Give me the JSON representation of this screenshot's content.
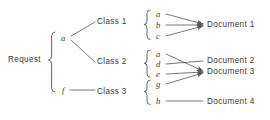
{
  "diagram": {
    "ink_color": "#3a3a3a",
    "line_color": "#555555",
    "background": "#ffffff",
    "root": {
      "label": "Request"
    },
    "level1_nodes": [
      {
        "id": "a",
        "label": "a"
      },
      {
        "id": "f",
        "label": "f"
      }
    ],
    "classes": [
      {
        "id": "class1",
        "label": "Class 1"
      },
      {
        "id": "class2",
        "label": "Class 2"
      },
      {
        "id": "class3",
        "label": "Class 3"
      }
    ],
    "terms": [
      {
        "id": "t-a1",
        "label": "a",
        "group": "class1"
      },
      {
        "id": "t-b",
        "label": "b",
        "group": "class1"
      },
      {
        "id": "t-c",
        "label": "c",
        "group": "class1"
      },
      {
        "id": "t-a2",
        "label": "a",
        "group": "class2"
      },
      {
        "id": "t-d",
        "label": "d",
        "group": "class2"
      },
      {
        "id": "t-e",
        "label": "e",
        "group": "class2"
      },
      {
        "id": "t-g",
        "label": "g",
        "group": "class3"
      },
      {
        "id": "t-h",
        "label": "h",
        "group": "class3"
      }
    ],
    "documents": [
      {
        "id": "doc1",
        "label": "Document 1"
      },
      {
        "id": "doc2",
        "label": "Document 2"
      },
      {
        "id": "doc3",
        "label": "Document 3"
      },
      {
        "id": "doc4",
        "label": "Document 4"
      }
    ],
    "edges": [
      {
        "from": "Request",
        "to": "a"
      },
      {
        "from": "Request",
        "to": "f"
      },
      {
        "from": "a",
        "to": "class1"
      },
      {
        "from": "a",
        "to": "class2"
      },
      {
        "from": "f",
        "to": "class3"
      },
      {
        "from": "t-a1",
        "to": "doc1"
      },
      {
        "from": "t-b",
        "to": "doc1"
      },
      {
        "from": "t-c",
        "to": "doc1"
      },
      {
        "from": "t-a2",
        "to": "doc3"
      },
      {
        "from": "t-d",
        "to": "doc2"
      },
      {
        "from": "t-e",
        "to": "doc3"
      },
      {
        "from": "t-g",
        "to": "doc3"
      },
      {
        "from": "t-h",
        "to": "doc4"
      }
    ]
  }
}
